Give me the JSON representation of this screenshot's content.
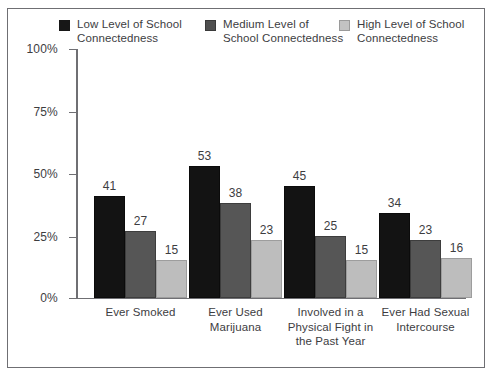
{
  "chart_data": {
    "type": "bar",
    "title": "",
    "xlabel": "",
    "ylabel": "",
    "ylim": [
      0,
      100
    ],
    "yticks": [
      "0%",
      "25%",
      "50%",
      "75%",
      "100%"
    ],
    "ytick_values": [
      0,
      25,
      50,
      75,
      100
    ],
    "grid": false,
    "legend_position": "top",
    "categories": [
      "Ever Smoked",
      "Ever Used\nMarijuana",
      "Involved in a\nPhysical Fight in\nthe Past Year",
      "Ever Had Sexual\nIntercourse"
    ],
    "series": [
      {
        "name": "Low Level of School\nConnectedness",
        "color": "#131313",
        "values": [
          41,
          53,
          45,
          34
        ]
      },
      {
        "name": "Medium Level of\nSchool Connectedness",
        "color": "#565656",
        "values": [
          27,
          38,
          25,
          23
        ]
      },
      {
        "name": "High Level of School\nConnectedness",
        "color": "#bdbdbd",
        "values": [
          15,
          23,
          15,
          16
        ]
      }
    ],
    "value_labels": [
      [
        41,
        27,
        15
      ],
      [
        53,
        38,
        23
      ],
      [
        45,
        25,
        15
      ],
      [
        34,
        23,
        16
      ]
    ]
  },
  "legend": {
    "items": [
      {
        "label": "Low Level of School\nConnectedness",
        "swatch": "low"
      },
      {
        "label": "Medium Level of\nSchool Connectedness",
        "swatch": "medium"
      },
      {
        "label": "High Level of School\nConnectedness",
        "swatch": "high"
      }
    ]
  },
  "axis": {
    "y_labels": [
      "100%",
      "75%",
      "50%",
      "25%",
      "0%"
    ]
  },
  "groups": [
    {
      "category": "Ever Smoked",
      "bars": [
        {
          "series": "low",
          "value": 41,
          "label": "41"
        },
        {
          "series": "medium",
          "value": 27,
          "label": "27"
        },
        {
          "series": "high",
          "value": 15,
          "label": "15"
        }
      ]
    },
    {
      "category": "Ever Used\nMarijuana",
      "bars": [
        {
          "series": "low",
          "value": 53,
          "label": "53"
        },
        {
          "series": "medium",
          "value": 38,
          "label": "38"
        },
        {
          "series": "high",
          "value": 23,
          "label": "23"
        }
      ]
    },
    {
      "category": "Involved in a\nPhysical Fight in\nthe Past Year",
      "bars": [
        {
          "series": "low",
          "value": 45,
          "label": "45"
        },
        {
          "series": "medium",
          "value": 25,
          "label": "25"
        },
        {
          "series": "high",
          "value": 15,
          "label": "15"
        }
      ]
    },
    {
      "category": "Ever Had Sexual\nIntercourse",
      "bars": [
        {
          "series": "low",
          "value": 34,
          "label": "34"
        },
        {
          "series": "medium",
          "value": 23,
          "label": "23"
        },
        {
          "series": "high",
          "value": 16,
          "label": "16"
        }
      ]
    }
  ],
  "colors": {
    "low": "#131313",
    "medium": "#565656",
    "high": "#bdbdbd",
    "axis": "#6f6f73",
    "text": "#3d3d3f",
    "background": "#ffffff"
  }
}
